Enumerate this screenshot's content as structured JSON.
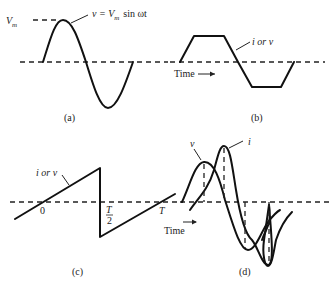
{
  "panels": {
    "a": {
      "caption": "(a)",
      "peak_label": "V",
      "peak_label_sub": "m",
      "curve_label_prefix": "v = V",
      "curve_label_sub": "m",
      "curve_label_suffix": "sin ωt"
    },
    "b": {
      "caption": "(b)",
      "curve_label": "i or v",
      "axis_label": "Time"
    },
    "c": {
      "caption": "(c)",
      "curve_label": "i or v",
      "tick_zero": "0",
      "tick_half_num": "T",
      "tick_half_den": "2",
      "tick_period": "T"
    },
    "d": {
      "caption": "(d)",
      "voltage_label": "v",
      "current_label": "i",
      "axis_label": "Time"
    }
  },
  "colors": {
    "line": "#111111",
    "background": "#ffffff"
  }
}
